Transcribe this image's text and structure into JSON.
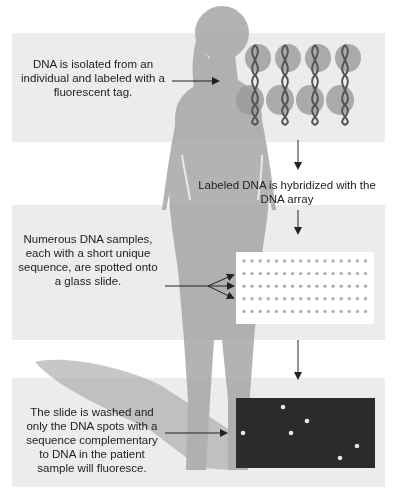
{
  "diagram": {
    "title": "",
    "steps": [
      {
        "id": "isolate",
        "text": "DNA is isolated from an individual and labeled with a fluorescent tag."
      },
      {
        "id": "hybridize",
        "text": "Labeled DNA is hybridized with the DNA array"
      },
      {
        "id": "spot",
        "text": "Numerous DNA samples, each with a short unique sequence, are spotted onto a glass slide."
      },
      {
        "id": "wash",
        "text": "The slide is washed and only the DNA spots with a sequence complementary to DNA in the patient sample will fluoresce."
      }
    ],
    "elements": {
      "dna_helices_count": 4,
      "array_rows": 5,
      "array_cols": 16,
      "fluorescent_spots": 7
    },
    "colors": {
      "panel_bg": "#ececec",
      "silhouette": "#a6a6a6",
      "helix": "#555555",
      "helix_glow": "#9a9a9a",
      "array_dot": "#b0b0b0",
      "dark_slide": "#2b2b2b",
      "fluorescent_spot": "#e6e6e6"
    }
  }
}
